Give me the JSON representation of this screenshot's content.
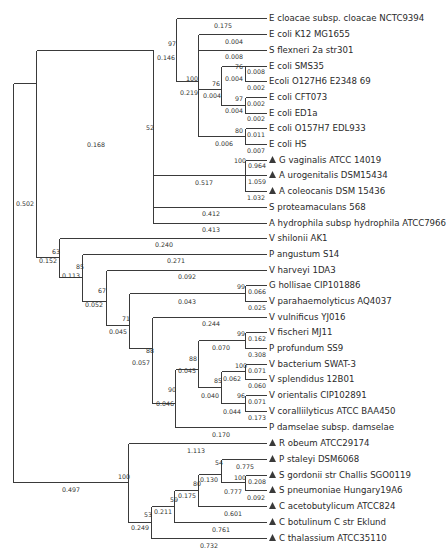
{
  "figure": {
    "type": "phylogenetic-tree",
    "line_color": "#3a3a3a",
    "text_color": "#2a2a2a",
    "marker": "filled-triangle"
  },
  "leaves": [
    {
      "label": "E cloacae subsp. cloacae NCTC9394",
      "marked": false,
      "y": 18
    },
    {
      "label": "E coli K12 MG1655",
      "marked": false,
      "y": 34
    },
    {
      "label": "S flexneri 2a str301",
      "marked": false,
      "y": 50
    },
    {
      "label": "E coli SMS35",
      "marked": false,
      "y": 66
    },
    {
      "label": "Ecoli O127H6 E2348 69",
      "marked": false,
      "y": 81
    },
    {
      "label": "E coli CFT073",
      "marked": false,
      "y": 97
    },
    {
      "label": "E coli ED1a",
      "marked": false,
      "y": 113
    },
    {
      "label": "E coli O157H7 EDL933",
      "marked": false,
      "y": 128
    },
    {
      "label": "E coli HS",
      "marked": false,
      "y": 144
    },
    {
      "label": "G vaginalis ATCC 14019",
      "marked": true,
      "y": 160
    },
    {
      "label": "A urogenitalis DSM15434",
      "marked": true,
      "y": 175
    },
    {
      "label": "A coleocanis DSM 15436",
      "marked": true,
      "y": 191
    },
    {
      "label": "S proteamaculans 568",
      "marked": false,
      "y": 207
    },
    {
      "label": "A hydrophila subsp hydrophila ATCC7966",
      "marked": false,
      "y": 223
    },
    {
      "label": "V shilonii AK1",
      "marked": false,
      "y": 238
    },
    {
      "label": "P angustum S14",
      "marked": false,
      "y": 254
    },
    {
      "label": "V harveyi 1DA3",
      "marked": false,
      "y": 270
    },
    {
      "label": "G hollisae CIP101886",
      "marked": false,
      "y": 285
    },
    {
      "label": "V parahaemolyticus AQ4037",
      "marked": false,
      "y": 301
    },
    {
      "label": "V vulnificus YJ016",
      "marked": false,
      "y": 317
    },
    {
      "label": "V fischeri MJ11",
      "marked": false,
      "y": 332
    },
    {
      "label": "P profundum SS9",
      "marked": false,
      "y": 348
    },
    {
      "label": "V bacterium SWAT-3",
      "marked": false,
      "y": 364
    },
    {
      "label": "V splendidus 12B01",
      "marked": false,
      "y": 379
    },
    {
      "label": "V orientalis CIP102891",
      "marked": false,
      "y": 395
    },
    {
      "label": "V coralliilyticus ATCC BAA450",
      "marked": false,
      "y": 411
    },
    {
      "label": "P damselae subsp. damselae",
      "marked": false,
      "y": 427
    },
    {
      "label": "R obeum ATCC29174",
      "marked": true,
      "y": 443
    },
    {
      "label": "P staleyi DSM6068",
      "marked": true,
      "y": 459
    },
    {
      "label": "S gordonii str Challis SGO0119",
      "marked": true,
      "y": 475
    },
    {
      "label": "S pneumoniae Hungary19A6",
      "marked": true,
      "y": 490
    },
    {
      "label": "C acetobutylicum ATCC824",
      "marked": true,
      "y": 506
    },
    {
      "label": "C botulinum C str Eklund",
      "marked": true,
      "y": 522
    },
    {
      "label": "C thalassium ATCC35110",
      "marked": true,
      "y": 538
    }
  ],
  "bootstrap_values": [
    {
      "value": "97",
      "x": 168,
      "y": 46
    },
    {
      "value": "100",
      "x": 186,
      "y": 81
    },
    {
      "value": "76",
      "x": 235,
      "y": 69
    },
    {
      "value": "76",
      "x": 212,
      "y": 86
    },
    {
      "value": "97",
      "x": 235,
      "y": 101
    },
    {
      "value": "80",
      "x": 235,
      "y": 133
    },
    {
      "value": "52",
      "x": 146,
      "y": 130
    },
    {
      "value": "100",
      "x": 234,
      "y": 163
    },
    {
      "value": "63",
      "x": 52,
      "y": 254
    },
    {
      "value": "85",
      "x": 76,
      "y": 269
    },
    {
      "value": "67",
      "x": 98,
      "y": 293
    },
    {
      "value": "99",
      "x": 237,
      "y": 289
    },
    {
      "value": "71",
      "x": 122,
      "y": 321
    },
    {
      "value": "99",
      "x": 237,
      "y": 336
    },
    {
      "value": "88",
      "x": 146,
      "y": 353
    },
    {
      "value": "88",
      "x": 189,
      "y": 361
    },
    {
      "value": "100",
      "x": 235,
      "y": 368
    },
    {
      "value": "85",
      "x": 214,
      "y": 383
    },
    {
      "value": "90",
      "x": 168,
      "y": 392
    },
    {
      "value": "96",
      "x": 237,
      "y": 398
    },
    {
      "value": "100",
      "x": 118,
      "y": 479
    },
    {
      "value": "54",
      "x": 215,
      "y": 465
    },
    {
      "value": "100",
      "x": 234,
      "y": 480
    },
    {
      "value": "80",
      "x": 193,
      "y": 486
    },
    {
      "value": "59",
      "x": 170,
      "y": 502
    },
    {
      "value": "53",
      "x": 144,
      "y": 517
    }
  ],
  "branch_lengths": [
    {
      "value": "0.175",
      "x": 214,
      "y": 28
    },
    {
      "value": "0.004",
      "x": 225,
      "y": 44
    },
    {
      "value": "0.008",
      "x": 225,
      "y": 59
    },
    {
      "value": "0.146",
      "x": 157,
      "y": 60
    },
    {
      "value": "0.008",
      "x": 247,
      "y": 74
    },
    {
      "value": "0.004",
      "x": 225,
      "y": 81
    },
    {
      "value": "0.002",
      "x": 247,
      "y": 90
    },
    {
      "value": "0.219",
      "x": 180,
      "y": 95
    },
    {
      "value": "0.004",
      "x": 203,
      "y": 98
    },
    {
      "value": "0.002",
      "x": 247,
      "y": 106
    },
    {
      "value": "0.004",
      "x": 225,
      "y": 113
    },
    {
      "value": "0.002",
      "x": 247,
      "y": 121
    },
    {
      "value": "0.011",
      "x": 247,
      "y": 137
    },
    {
      "value": "0.006",
      "x": 215,
      "y": 146
    },
    {
      "value": "0.007",
      "x": 247,
      "y": 153
    },
    {
      "value": "0.168",
      "x": 87,
      "y": 147
    },
    {
      "value": "0.964",
      "x": 248,
      "y": 168
    },
    {
      "value": "0.517",
      "x": 195,
      "y": 185
    },
    {
      "value": "1.059",
      "x": 248,
      "y": 184
    },
    {
      "value": "1.032",
      "x": 247,
      "y": 200
    },
    {
      "value": "0.502",
      "x": 16,
      "y": 206
    },
    {
      "value": "0.412",
      "x": 202,
      "y": 216
    },
    {
      "value": "0.413",
      "x": 202,
      "y": 232
    },
    {
      "value": "0.240",
      "x": 155,
      "y": 247
    },
    {
      "value": "0.152",
      "x": 39,
      "y": 263
    },
    {
      "value": "0.271",
      "x": 167,
      "y": 263
    },
    {
      "value": "0.113",
      "x": 62,
      "y": 278
    },
    {
      "value": "0.092",
      "x": 178,
      "y": 279
    },
    {
      "value": "0.066",
      "x": 248,
      "y": 294
    },
    {
      "value": "0.052",
      "x": 85,
      "y": 307
    },
    {
      "value": "0.043",
      "x": 178,
      "y": 304
    },
    {
      "value": "0.025",
      "x": 248,
      "y": 310
    },
    {
      "value": "0.045",
      "x": 109,
      "y": 334
    },
    {
      "value": "0.244",
      "x": 202,
      "y": 326
    },
    {
      "value": "0.162",
      "x": 248,
      "y": 341
    },
    {
      "value": "0.070",
      "x": 212,
      "y": 350
    },
    {
      "value": "0.308",
      "x": 248,
      "y": 357
    },
    {
      "value": "0.057",
      "x": 132,
      "y": 365
    },
    {
      "value": "0.045",
      "x": 178,
      "y": 373
    },
    {
      "value": "0.071",
      "x": 248,
      "y": 373
    },
    {
      "value": "0.062",
      "x": 223,
      "y": 381
    },
    {
      "value": "0.060",
      "x": 248,
      "y": 388
    },
    {
      "value": "0.040",
      "x": 201,
      "y": 398
    },
    {
      "value": "0.071",
      "x": 248,
      "y": 404
    },
    {
      "value": "0.046",
      "x": 156,
      "y": 406
    },
    {
      "value": "0.044",
      "x": 223,
      "y": 414
    },
    {
      "value": "0.173",
      "x": 248,
      "y": 420
    },
    {
      "value": "0.170",
      "x": 212,
      "y": 437
    },
    {
      "value": "1.113",
      "x": 187,
      "y": 453
    },
    {
      "value": "0.775",
      "x": 236,
      "y": 469
    },
    {
      "value": "0.130",
      "x": 200,
      "y": 482
    },
    {
      "value": "0.208",
      "x": 248,
      "y": 484
    },
    {
      "value": "0.497",
      "x": 62,
      "y": 492
    },
    {
      "value": "0.777",
      "x": 224,
      "y": 494
    },
    {
      "value": "0.175",
      "x": 178,
      "y": 498
    },
    {
      "value": "0.092",
      "x": 247,
      "y": 500
    },
    {
      "value": "0.211",
      "x": 154,
      "y": 514
    },
    {
      "value": "0.601",
      "x": 224,
      "y": 516
    },
    {
      "value": "0.249",
      "x": 131,
      "y": 530
    },
    {
      "value": "0.761",
      "x": 212,
      "y": 532
    },
    {
      "value": "0.732",
      "x": 200,
      "y": 548
    }
  ],
  "edges": [
    [
      13,
      83,
      13,
      482
    ],
    [
      13,
      83,
      36,
      83
    ],
    [
      13,
      482,
      128,
      482
    ],
    [
      36,
      50,
      36,
      257
    ],
    [
      36,
      50,
      153,
      50
    ],
    [
      36,
      257,
      59,
      257
    ],
    [
      153,
      50,
      153,
      223
    ],
    [
      153,
      223,
      266,
      223
    ],
    [
      153,
      207,
      266,
      207
    ],
    [
      153,
      175,
      245,
      175
    ],
    [
      176,
      18,
      176,
      81
    ],
    [
      176,
      18,
      266,
      18
    ],
    [
      198,
      34,
      198,
      136
    ],
    [
      198,
      34,
      266,
      34
    ],
    [
      198,
      50,
      266,
      50
    ],
    [
      176,
      81,
      198,
      81
    ],
    [
      221,
      66,
      221,
      89
    ],
    [
      221,
      89,
      198,
      89
    ],
    [
      221,
      66,
      245,
      66
    ],
    [
      245,
      66,
      245,
      81
    ],
    [
      245,
      66,
      266,
      66
    ],
    [
      245,
      81,
      266,
      81
    ],
    [
      221,
      105,
      221,
      89
    ],
    [
      221,
      105,
      245,
      105
    ],
    [
      245,
      97,
      245,
      113
    ],
    [
      245,
      97,
      266,
      97
    ],
    [
      245,
      113,
      266,
      113
    ],
    [
      198,
      136,
      245,
      136
    ],
    [
      245,
      128,
      245,
      144
    ],
    [
      245,
      128,
      266,
      128
    ],
    [
      245,
      144,
      266,
      144
    ],
    [
      245,
      160,
      245,
      191
    ],
    [
      245,
      160,
      266,
      160
    ],
    [
      245,
      175,
      266,
      175
    ],
    [
      245,
      191,
      266,
      191
    ],
    [
      59,
      238,
      59,
      257
    ],
    [
      59,
      238,
      266,
      238
    ],
    [
      59,
      257,
      59,
      277
    ],
    [
      59,
      277,
      82,
      277
    ],
    [
      82,
      254,
      82,
      277
    ],
    [
      82,
      254,
      266,
      254
    ],
    [
      82,
      277,
      82,
      301
    ],
    [
      82,
      301,
      106,
      301
    ],
    [
      106,
      270,
      106,
      301
    ],
    [
      106,
      270,
      266,
      270
    ],
    [
      106,
      301,
      106,
      325
    ],
    [
      106,
      325,
      129,
      325
    ],
    [
      129,
      293,
      129,
      325
    ],
    [
      129,
      293,
      245,
      293
    ],
    [
      245,
      285,
      245,
      301
    ],
    [
      245,
      285,
      266,
      285
    ],
    [
      245,
      301,
      266,
      301
    ],
    [
      129,
      325,
      129,
      348
    ],
    [
      129,
      348,
      152,
      348
    ],
    [
      152,
      317,
      152,
      348
    ],
    [
      152,
      317,
      266,
      317
    ],
    [
      152,
      348,
      152,
      403
    ],
    [
      152,
      403,
      175,
      403
    ],
    [
      175,
      369,
      175,
      427
    ],
    [
      175,
      369,
      198,
      369
    ],
    [
      175,
      427,
      266,
      427
    ],
    [
      198,
      340,
      198,
      369
    ],
    [
      198,
      340,
      245,
      340
    ],
    [
      245,
      332,
      245,
      348
    ],
    [
      245,
      332,
      266,
      332
    ],
    [
      245,
      348,
      266,
      348
    ],
    [
      198,
      369,
      198,
      387
    ],
    [
      198,
      387,
      221,
      387
    ],
    [
      221,
      371,
      221,
      403
    ],
    [
      221,
      371,
      245,
      371
    ],
    [
      245,
      364,
      245,
      379
    ],
    [
      245,
      364,
      266,
      364
    ],
    [
      245,
      379,
      266,
      379
    ],
    [
      221,
      403,
      245,
      403
    ],
    [
      245,
      395,
      245,
      411
    ],
    [
      245,
      395,
      266,
      395
    ],
    [
      245,
      411,
      266,
      411
    ],
    [
      128,
      443,
      128,
      482
    ],
    [
      128,
      443,
      266,
      443
    ],
    [
      128,
      482,
      128,
      522
    ],
    [
      128,
      522,
      151,
      522
    ],
    [
      151,
      506,
      151,
      538
    ],
    [
      151,
      538,
      266,
      538
    ],
    [
      151,
      506,
      174,
      506
    ],
    [
      174,
      490,
      174,
      522
    ],
    [
      174,
      522,
      266,
      522
    ],
    [
      174,
      490,
      198,
      490
    ],
    [
      198,
      474,
      198,
      506
    ],
    [
      198,
      506,
      266,
      506
    ],
    [
      198,
      474,
      221,
      474
    ],
    [
      221,
      459,
      221,
      482
    ],
    [
      221,
      459,
      266,
      459
    ],
    [
      221,
      482,
      245,
      482
    ],
    [
      245,
      475,
      245,
      490
    ],
    [
      245,
      475,
      266,
      475
    ],
    [
      245,
      490,
      266,
      490
    ]
  ]
}
